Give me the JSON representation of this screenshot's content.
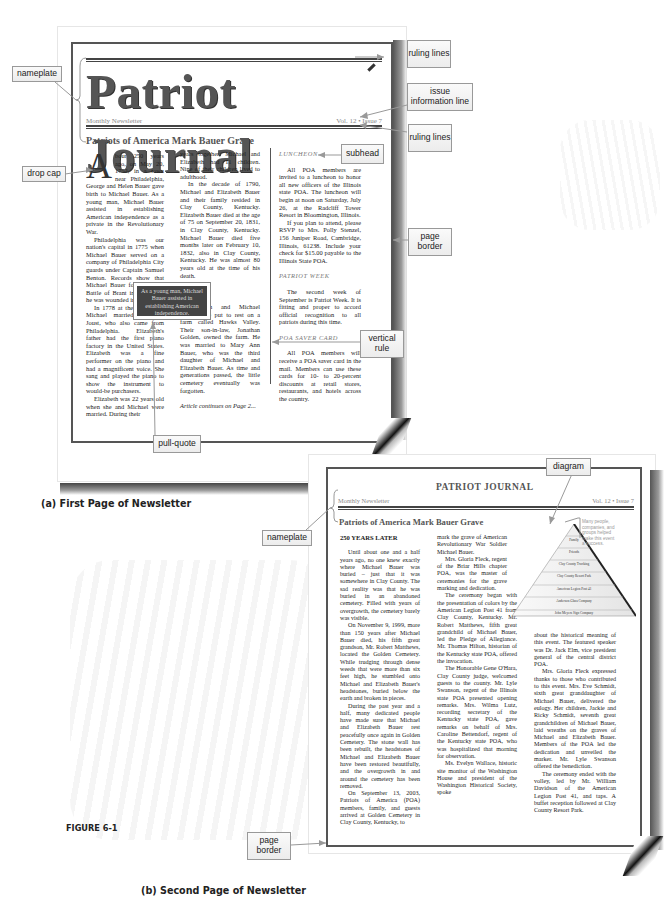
{
  "figure": {
    "label": "FIGURE 6-1",
    "caption_a": "(a) First Page of Newsletter",
    "caption_b": "(b) Second Page of Newsletter"
  },
  "annotations": {
    "nameplate_1": "nameplate",
    "drop_cap": "drop cap",
    "ruling_lines_top": "ruling lines",
    "issue_info_line": "issue information line",
    "ruling_lines_bottom": "ruling lines",
    "subhead": "subhead",
    "page_border_1": "page border",
    "vertical_rule": "vertical rule",
    "pull_quote": "pull-quote",
    "diagram": "diagram",
    "nameplate_2": "nameplate",
    "page_border_2": "page border"
  },
  "page1": {
    "nameplate_title": "Patriot Journal",
    "issue_left": "Monthly Newsletter",
    "issue_right": "Vol. 12 • Issue 7",
    "headline": "Patriots of America Mark Bauer Grave",
    "drop_cap_letter": "A",
    "col1": [
      "bout 250 years ago, on May 20, 1752, in a town near Philadelphia, George and Helen Bauer gave birth to Michael Bauer. As a young man, Michael Bauer assisted in establishing American independence as a private in the Revolutionary War.",
      "Philadelphia was our nation's capital in 1775 when Michael Bauer served on a company of Philadelphia City guards under Captain Samuel Benton. Records show that Michael Bauer fought at the Battle of Brant in 1777, and he was wounded in that battle.",
      "In 1778 at the age of 26, Michael married Elizabeth Joust, who also came from Philadelphia. Elizabeth's father had the first piano factory in the United States. Elizabeth was a fine performer on the piano and had a magnificent voice. She sang and played the piano to show the instrument to would-be purchasers.",
      "Elizabeth was 22 years old when she and Michael were married. During their"
    ],
    "col2": [
      "years together, Michael and Elizabeth had 11 children. Nine of their children lived to adulthood.",
      "In the decade of 1790, Michael and Elizabeth Bauer and their family resided in Clay County, Kentucky. Elizabeth Bauer died at the age of 75 on September 20, 1831, in Clay County, Kentucky. Michael Bauer died five months later on February 10, 1832, also in Clay County, Kentucky. He was almost 80 years old at the time of his death.",
      "Elizabeth and Michael Bauer were put to rest on a farm called Hawks Valley. Their son-in-law, Jonathan Golden, owned the farm. He was married to Mary Ann Bauer, who was the third daughter of Michael and Elizabeth Bauer. As time and generations passed, the little cemetery eventually was forgotten."
    ],
    "col2_continued": "Article continues on Page 2...",
    "pull_quote": "As a young man, Michael Bauer assisted in establishing American independence.",
    "col3": {
      "subhead_1": "LUNCHEON",
      "luncheon": [
        "All POA members are invited to a luncheon to honor all new officers of the Illinois state POA. The luncheon will begin at noon on Saturday, July 26, at the Radcliff Tower Resort in Bloomington, Illinois.",
        "If you plan to attend, please RSVP to Mrs. Polly Stenzel, 156 Juniper Road, Cambridge, Illinois, 61238. Include your check for $15.00 payable to the Illinois State POA."
      ],
      "subhead_2": "PATRIOT WEEK",
      "patriot_week": "The second week of September is Patriot Week. It is fitting and proper to accord official recognition to all patriots during this time.",
      "subhead_3": "POA SAVER CARD",
      "saver_card": "All POA members will receive a POA saver card in the mail. Members can use these cards for 10- to 20-percent discounts at retail stores, restaurants, and hotels across the country."
    }
  },
  "page2": {
    "title": "PATRIOT JOURNAL",
    "issue_left": "Monthly Newsletter",
    "issue_right": "Vol. 12 • Issue 7",
    "headline": "Patriots of America Mark Bauer Grave",
    "subhead": "250 YEARS LATER",
    "col1": [
      "Until about one and a half years ago, no one knew exactly where Michael Bauer was buried – just that it was somewhere in Clay County. The sad reality was that he was buried in an abandoned cemetery. Filled with years of overgrowth, the cemetery barely was visible.",
      "On November 9, 1999, more than 150 years after Michael Bauer died, his fifth great grandson, Mr. Robert Matthews, located the Golden Cemetery. While trudging through dense weeds that were more than six feet high, he stumbled onto Michael and Elizabeth Bauer's headstones, buried below the earth and broken in pieces.",
      "During the past year and a half, many dedicated people have made sure that Michael and Elizabeth Bauer rest peacefully once again in Golden Cemetery. The stone wall has been rebuilt, the headstones of Michael and Elizabeth Bauer have been restored beautifully, and the overgrowth in and around the cemetery has been removed.",
      "On September 13, 2003, Patriots of America (POA) members, family, and guests arrived at Golden Cemetery in Clay County, Kentucky, to"
    ],
    "col2": [
      "mark the grave of American Revolutionary War Soldier Michael Bauer.",
      "Mrs. Gloria Fleck, regent of the Briar Hills chapter POA, was the master of ceremonies for the grave marking and dedication.",
      "The ceremony began with the presentation of colors by the American Legion Post 41 from Clay County, Kentucky. Mr. Robert Matthews, fifth great grandchild of Michael Bauer, led the Pledge of Allegiance. Mr. Thomas Hilton, historian of the Kentucky state POA, offered the invocation.",
      "The Honorable Gene O'Hara, Clay County judge, welcomed guests to the county. Mr. Lyle Swanson, regent of the Illinois state POA presented opening remarks. Mrs. Wilma Lutz, recording secretary of the Kentucky state POA, gave remarks on behalf of Mrs. Caroline Bettendorf, regent of the Kentucky state POA, who was hospitalized that morning for observation.",
      "Ms. Evelyn Wallace, historic site monitor of the Washington House and president of the Washington Historical Society, spoke"
    ],
    "col3": [
      "about the historical meaning of this event. The featured speaker was Dr. Jack Elm, vice president general of the central district POA.",
      "Mrs. Gloria Fleck expressed thanks to those who contributed to this event. Mrs. Eve Schmidt, sixth great granddaughter of Michael Bauer, delivered the eulogy. Her children, Jackie and Ricky Schmidt, seventh great grandchildren of Michael Bauer, laid wreaths on the graves of Michael and Elizabeth Bauer. Members of the POA led the dedication and unveiled the marker. Mr. Lyle Swanson offered the benediction.",
      "The ceremony ended with the volley, led by Mr. William Davidson of the American Legion Post 41, and taps. A buffet reception followed at Clay County Resort Park."
    ],
    "diagram": {
      "note": "Many people, companies, and groups helped make this event a success.",
      "levels": [
        "Family",
        "Friends",
        "Clay County Trucking",
        "Clay County Resort Park",
        "American Legion Post 41",
        "Anderson Glass Company",
        "John Meyers Sign Company"
      ]
    }
  }
}
